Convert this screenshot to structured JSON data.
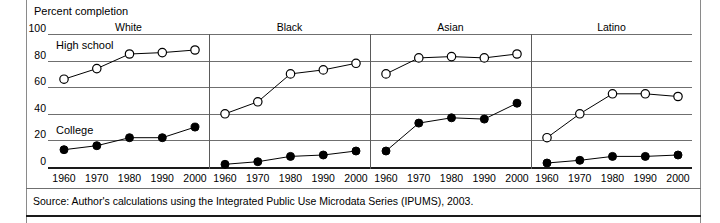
{
  "figure": {
    "axis_title": "Percent completion",
    "source": "Source: Author's calculations using the Integrated Public Use Microdata Series (IPUMS), 2003.",
    "series_labels": {
      "high_school": "High school",
      "college": "College"
    }
  },
  "chart_data": {
    "type": "line",
    "title": "Percent completion",
    "xlabel": "",
    "ylabel": "Percent completion",
    "ylim": [
      0,
      100
    ],
    "yticks": [
      0,
      20,
      40,
      60,
      80,
      100
    ],
    "ytick_labels": [
      "0",
      "20",
      "40",
      "60",
      "80",
      "100"
    ],
    "x": [
      1960,
      1970,
      1980,
      1990,
      2000
    ],
    "xtick_labels": [
      "1960",
      "1970",
      "1980",
      "1990",
      "2000"
    ],
    "grid": true,
    "legend": "inline-annotation",
    "panels": [
      {
        "name": "White",
        "series": [
          {
            "name": "High school",
            "marker": "open-circle",
            "values": [
              66,
              74,
              85,
              86,
              88
            ]
          },
          {
            "name": "College",
            "marker": "filled-circle",
            "values": [
              13,
              16,
              22,
              22,
              30
            ]
          }
        ]
      },
      {
        "name": "Black",
        "series": [
          {
            "name": "High school",
            "marker": "open-circle",
            "values": [
              40,
              49,
              70,
              73,
              78
            ]
          },
          {
            "name": "College",
            "marker": "filled-circle",
            "values": [
              2,
              4,
              8,
              9,
              12
            ]
          }
        ]
      },
      {
        "name": "Asian",
        "series": [
          {
            "name": "High school",
            "marker": "open-circle",
            "values": [
              70,
              82,
              83,
              82,
              85
            ]
          },
          {
            "name": "College",
            "marker": "filled-circle",
            "values": [
              12,
              33,
              37,
              36,
              48
            ]
          }
        ]
      },
      {
        "name": "Latino",
        "series": [
          {
            "name": "High school",
            "marker": "open-circle",
            "values": [
              22,
              40,
              55,
              55,
              53
            ]
          },
          {
            "name": "College",
            "marker": "filled-circle",
            "values": [
              3,
              5,
              8,
              8,
              9
            ]
          }
        ]
      }
    ]
  }
}
